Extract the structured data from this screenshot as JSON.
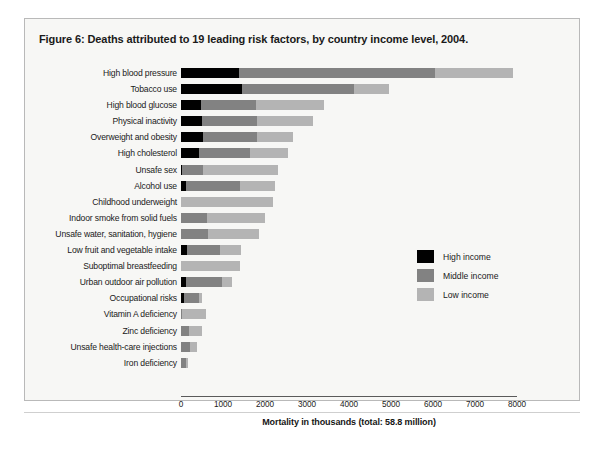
{
  "figure": {
    "title": "Figure 6: Deaths attributed to 19 leading risk factors, by country income level, 2004."
  },
  "legend": {
    "items": [
      {
        "label": "High income",
        "color": "#010101",
        "key": "high"
      },
      {
        "label": "Middle income",
        "color": "#828282",
        "key": "middle"
      },
      {
        "label": "Low income",
        "color": "#b4b4b4",
        "key": "low"
      }
    ]
  },
  "chart_data": {
    "type": "bar",
    "orientation": "horizontal",
    "stacked": true,
    "title": "Figure 6: Deaths attributed to 19 leading risk factors, by country income level, 2004.",
    "xlabel": "Mortality in thousands (total: 58.8 million)",
    "ylabel": "",
    "xlim": [
      0,
      8000
    ],
    "xticks": [
      0,
      1000,
      2000,
      3000,
      4000,
      5000,
      6000,
      7000,
      8000
    ],
    "grid": false,
    "legend_position": "middle-right",
    "categories": [
      "High blood pressure",
      "Tobacco use",
      "High blood glucose",
      "Physical inactivity",
      "Overweight and obesity",
      "High cholesterol",
      "Unsafe sex",
      "Alcohol use",
      "Childhood underweight",
      "Indoor smoke from solid fuels",
      "Unsafe water, sanitation, hygiene",
      "Low fruit and vegetable intake",
      "Suboptimal breastfeeding",
      "Urban outdoor air pollution",
      "Occupational risks",
      "Vitamin A deficiency",
      "Zinc deficiency",
      "Unsafe health-care injections",
      "Iron deficiency"
    ],
    "series": [
      {
        "name": "High income",
        "color": "#010101",
        "values": [
          1390,
          1460,
          470,
          510,
          520,
          420,
          20,
          110,
          0,
          0,
          0,
          140,
          0,
          130,
          70,
          0,
          0,
          0,
          0
        ]
      },
      {
        "name": "Middle income",
        "color": "#828282",
        "values": [
          4660,
          2660,
          1320,
          1290,
          1280,
          1220,
          500,
          1290,
          0,
          620,
          640,
          780,
          0,
          840,
          370,
          30,
          200,
          210,
          130
        ]
      },
      {
        "name": "Low income",
        "color": "#b4b4b4",
        "values": [
          1850,
          830,
          1610,
          1340,
          860,
          900,
          1780,
          840,
          2200,
          1380,
          1210,
          520,
          1400,
          240,
          70,
          570,
          310,
          180,
          40
        ]
      }
    ],
    "totals": [
      7900,
      4950,
      3400,
      3140,
      2660,
      2540,
      2300,
      2240,
      2200,
      2000,
      1850,
      1440,
      1400,
      1210,
      510,
      600,
      510,
      390,
      170
    ]
  },
  "axis": {
    "tick_labels": [
      "0",
      "1000",
      "2000",
      "3000",
      "4000",
      "5000",
      "6000",
      "7000",
      "8000"
    ],
    "title": "Mortality in thousands (total: 58.8 million)"
  }
}
